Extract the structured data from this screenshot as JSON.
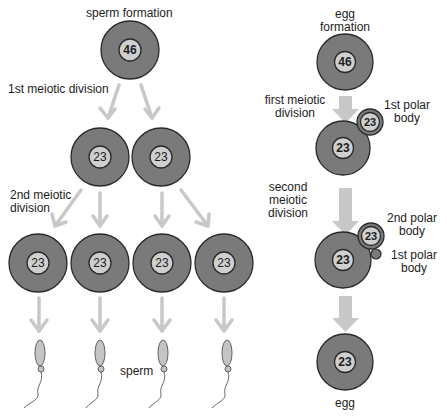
{
  "colors": {
    "cell_fill": "#7a7a7a",
    "cell_stroke": "#2a2a2a",
    "nucleus_fill": "#cfcfcf",
    "arrow": "#c8c8c8",
    "sperm_fill": "#c4c4c4"
  },
  "sperm_side": {
    "title": "sperm formation",
    "step1_label": "1st meiotic division",
    "step2_label_line1": "2nd meiotic",
    "step2_label_line2": "division",
    "product_label": "sperm",
    "cells": [
      {
        "id": "spermatocyte",
        "chromosomes": "46"
      },
      {
        "id": "secondary-1",
        "chromosomes": "23"
      },
      {
        "id": "secondary-2",
        "chromosomes": "23"
      },
      {
        "id": "spermatid-1",
        "chromosomes": "23"
      },
      {
        "id": "spermatid-2",
        "chromosomes": "23"
      },
      {
        "id": "spermatid-3",
        "chromosomes": "23"
      },
      {
        "id": "spermatid-4",
        "chromosomes": "23"
      }
    ]
  },
  "egg_side": {
    "title_line1": "egg",
    "title_line2": "formation",
    "step1_label_line1": "first meiotic",
    "step1_label_line2": "division",
    "step2_label_line1": "second",
    "step2_label_line2": "meiotic",
    "step2_label_line3": "division",
    "polar1_label_line1": "1st polar",
    "polar1_label_line2": "body",
    "polar2_label_line1": "2nd polar",
    "polar2_label_line2": "body",
    "polar1b_label_line1": "1st polar",
    "polar1b_label_line2": "body",
    "product_label": "egg",
    "cells": [
      {
        "id": "oocyte",
        "chromosomes": "46"
      },
      {
        "id": "secondary-oocyte",
        "chromosomes": "23"
      },
      {
        "id": "first-polar-body",
        "chromosomes": "23"
      },
      {
        "id": "ootid",
        "chromosomes": "23"
      },
      {
        "id": "second-polar-body",
        "chromosomes": "23"
      },
      {
        "id": "egg",
        "chromosomes": "23"
      }
    ]
  }
}
